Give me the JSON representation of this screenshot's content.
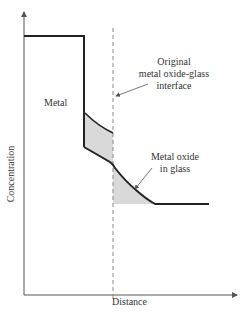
{
  "diagram": {
    "xlabel": "Distance",
    "ylabel": "Concentration",
    "labels": {
      "metal": "Metal",
      "interface_line1": "Original",
      "interface_line2": "metal oxide-glass",
      "interface_line3": "interface",
      "oxide_line1": "Metal oxide",
      "oxide_line2": "in glass"
    },
    "colors": {
      "line": "#222222",
      "shade": "#d9d9d9",
      "dashed": "#888888"
    }
  }
}
